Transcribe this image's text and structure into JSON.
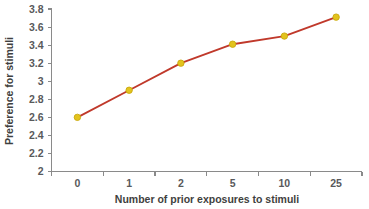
{
  "chart_data": {
    "type": "line",
    "title": "",
    "xlabel": "Number of prior exposures to stimuli",
    "ylabel": "Preference for stimuli",
    "categories": [
      "0",
      "1",
      "2",
      "5",
      "10",
      "25"
    ],
    "values": [
      2.6,
      2.9,
      3.2,
      3.41,
      3.5,
      3.71
    ],
    "series": [
      {
        "name": "Preference for stimuli",
        "values": [
          2.6,
          2.9,
          3.2,
          3.41,
          3.5,
          3.71
        ]
      }
    ],
    "ylim": [
      2,
      3.8
    ],
    "ytick_labels": [
      "2",
      "2.2",
      "2.4",
      "2.6",
      "2.8",
      "3",
      "3.2",
      "3.4",
      "3.6",
      "3.8"
    ],
    "ytick_values": [
      2,
      2.2,
      2.4,
      2.6,
      2.8,
      3,
      3.2,
      3.4,
      3.6,
      3.8
    ],
    "xtick_labels": [
      "0",
      "1",
      "2",
      "5",
      "10",
      "25"
    ],
    "grid": false,
    "legend": false,
    "legend_position": "none",
    "line_color": "#c0392b",
    "marker_color": "#e3c31d",
    "marker_edge_color": "#c9a90f",
    "marker_shape": "circle",
    "axis_color": "#8a8a8a",
    "text_color": "#58595b",
    "background_color": "#ffffff"
  },
  "axes": {
    "y_title": "Preference for stimuli",
    "x_title": "Number of prior exposures to stimuli"
  }
}
